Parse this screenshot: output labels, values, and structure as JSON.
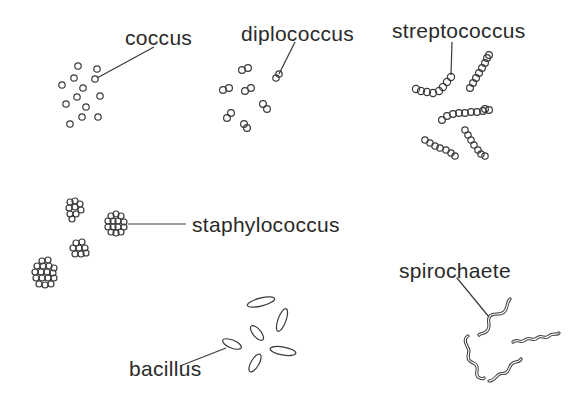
{
  "diagram": {
    "stroke_color": "#3a3a3a",
    "labels": {
      "coccus": "coccus",
      "diplococcus": "diplococcus",
      "streptococcus": "streptococcus",
      "staphylococcus": "staphylococcus",
      "bacillus": "bacillus",
      "spirochaete": "spirochaete"
    }
  }
}
